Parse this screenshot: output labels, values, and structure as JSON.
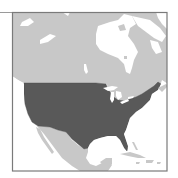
{
  "map": {
    "type": "locator-map",
    "region": "North America",
    "highlighted": "United States (contiguous)",
    "colors": {
      "background": "#ffffff",
      "water": "#ffffff",
      "land": "#c8c8c8",
      "highlight": "#595959",
      "border": "#8c8c8c",
      "frame": "#7a7a7a"
    },
    "features": [
      {
        "name": "Canada",
        "fill": "land"
      },
      {
        "name": "United States",
        "fill": "highlight"
      },
      {
        "name": "Mexico",
        "fill": "land"
      },
      {
        "name": "Hudson Bay",
        "fill": "water"
      },
      {
        "name": "Gulf of Mexico",
        "fill": "water"
      },
      {
        "name": "Great Lakes",
        "fill": "water"
      },
      {
        "name": "Cuba",
        "fill": "land"
      },
      {
        "name": "Caribbean islands",
        "fill": "land"
      },
      {
        "name": "Arctic islands",
        "fill": "water-gaps"
      }
    ]
  }
}
